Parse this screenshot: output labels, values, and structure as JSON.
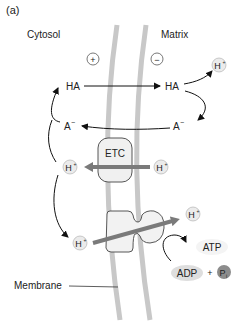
{
  "panel_label": "(a)",
  "regions": {
    "left": "Cytosol",
    "right": "Matrix",
    "membrane": "Membrane"
  },
  "charges": {
    "left": "+",
    "right": "−"
  },
  "molecules": {
    "ha_left": "HA",
    "ha_right": "HA",
    "a_left": "A",
    "a_right": "A",
    "a_charge": "−",
    "proton": "H",
    "proton_charge": "+",
    "etc": "ETC",
    "atp": "ATP",
    "adp": "ADP",
    "plus": "+",
    "pi": "P",
    "pi_sub": "i"
  },
  "colors": {
    "membrane": "#c8c8c8",
    "proton_fill": "#ebebeb",
    "gray_arrow": "#7a7a7a",
    "etc_fill": "#f0f0f0",
    "pi_fill": "#8c8c8c",
    "adp_fill": "#dedede"
  }
}
